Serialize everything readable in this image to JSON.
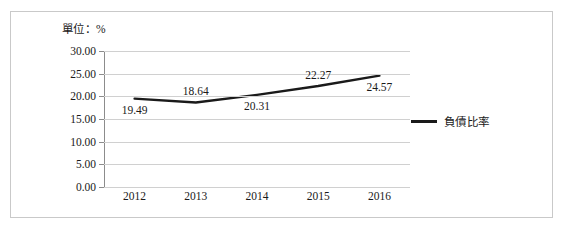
{
  "figure": {
    "unit_label": "單位：%"
  },
  "legend": {
    "position": "right",
    "entries": [
      {
        "label": "負債比率",
        "color": "#1a1a1a"
      }
    ],
    "label": "負債比率"
  },
  "chart_data": {
    "type": "line",
    "title": "",
    "subtitle": "",
    "xlabel": "",
    "ylabel": "",
    "unit": "單位：%",
    "categories": [
      "2012",
      "2013",
      "2014",
      "2015",
      "2016"
    ],
    "series": [
      {
        "name": "負債比率",
        "color": "#1a1a1a",
        "values": [
          19.49,
          18.64,
          20.31,
          22.27,
          24.57
        ]
      }
    ],
    "data_labels": [
      "19.49",
      "18.64",
      "20.31",
      "22.27",
      "24.57"
    ],
    "data_label_positions": [
      "below",
      "above",
      "below",
      "above",
      "below"
    ],
    "ylim": [
      0.0,
      30.0
    ],
    "ytick_values": [
      30.0,
      25.0,
      20.0,
      15.0,
      10.0,
      5.0,
      0.0
    ],
    "ytick_labels": [
      "30.00",
      "25.00",
      "20.00",
      "15.00",
      "10.00",
      "5.00",
      "0.00"
    ],
    "xtick_labels": [
      "2012",
      "2013",
      "2014",
      "2015",
      "2016"
    ],
    "grid": {
      "horizontal": true,
      "vertical": false,
      "color": "#d0d0d0"
    },
    "legend_position": "right",
    "markers": false
  }
}
